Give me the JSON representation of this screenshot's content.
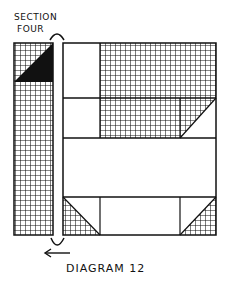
{
  "labels": {
    "section_line1": "SECTION",
    "section_line2": "FOUR",
    "caption": "DIAGRAM 12"
  },
  "colors": {
    "ink": "#111111",
    "paper": "#ffffff"
  },
  "parts": {
    "left_strip": "crosshatched strip with black triangle at top",
    "main_block": "quilt block with crosshatched and plain patches",
    "arrow": "left-pointing arrow indicating placement"
  }
}
